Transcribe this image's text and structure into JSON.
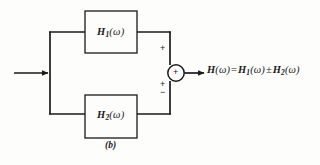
{
  "figure": {
    "caption": "(b)",
    "type": "block-diagram"
  },
  "blocks": [
    {
      "id": "h1",
      "label_main": "H",
      "label_sub": "1",
      "label_arg": "(ω)",
      "position": "top"
    },
    {
      "id": "h2",
      "label_main": "H",
      "label_sub": "2",
      "label_arg": "(ω)",
      "position": "bottom"
    }
  ],
  "summing_junction": {
    "inner_sign": "+",
    "top_input_sign": "+",
    "bottom_input_sign_plus": "+",
    "bottom_input_sign_minus": "−"
  },
  "output_equation": {
    "lhs_main": "H",
    "lhs_arg": "(ω)",
    "equals": "=",
    "term1_main": "H",
    "term1_sub": "1",
    "term1_arg": "(ω)",
    "operator": "±",
    "term2_main": "H",
    "term2_sub": "2",
    "term2_arg": "(ω)",
    "full_text": "H(ω) = H₁(ω) ± H₂(ω)"
  },
  "signals": {
    "input_arrow": "input-signal-arrow",
    "output_arrow": "output-signal-arrow"
  },
  "colors": {
    "line": "#1a1a1a",
    "background": "#fdfdfb",
    "text": "#1a1a1a"
  }
}
